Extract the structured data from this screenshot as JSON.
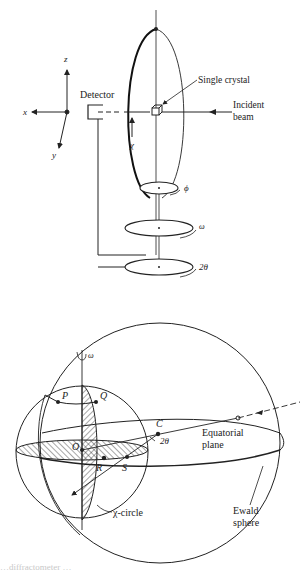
{
  "figure": {
    "top_diagram": {
      "title": "Four-circle diffractometer schematic",
      "axes": {
        "x": "x",
        "y": "y",
        "z": "z"
      },
      "labels": {
        "detector": "Detector",
        "single_crystal": "Single crystal",
        "incident_beam_line1": "Incident",
        "incident_beam_line2": "beam",
        "chi": "χ",
        "phi": "ϕ",
        "omega": "ω",
        "two_theta": "2θ"
      }
    },
    "bottom_diagram": {
      "title": "Ewald sphere construction",
      "labels": {
        "omega": "ω",
        "P": "P",
        "Q": "Q",
        "O": "O",
        "R": "R",
        "S": "S",
        "C": "C",
        "two_theta": "2θ",
        "equatorial_line1": "Equatorial",
        "equatorial_line2": "plane",
        "chi_circle": "χ-circle",
        "ewald_line1": "Ewald",
        "ewald_line2": "sphere"
      }
    },
    "caption_fragment": "…diffractometer …"
  }
}
